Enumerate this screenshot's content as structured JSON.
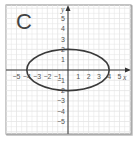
{
  "panel": {
    "label": "C"
  },
  "axes": {
    "x_label": "x",
    "y_label": "y",
    "x_ticks": [
      "−5",
      "−4",
      "−3",
      "−2",
      "−1",
      "1",
      "2",
      "3",
      "4",
      "5"
    ],
    "y_ticks": [
      "5",
      "4",
      "3",
      "2",
      "1",
      "−1",
      "−2",
      "−3",
      "−4",
      "−5"
    ],
    "xlim": [
      -6,
      6
    ],
    "ylim": [
      -6,
      6
    ]
  },
  "curve": {
    "type": "ellipse",
    "center": [
      0,
      0
    ],
    "semi_major_x": 4,
    "semi_minor_y": 2,
    "color": "#3a3a3a"
  },
  "colors": {
    "frame": "#8a8a8a",
    "grid": "#e4e4e4",
    "axis": "#333333"
  }
}
